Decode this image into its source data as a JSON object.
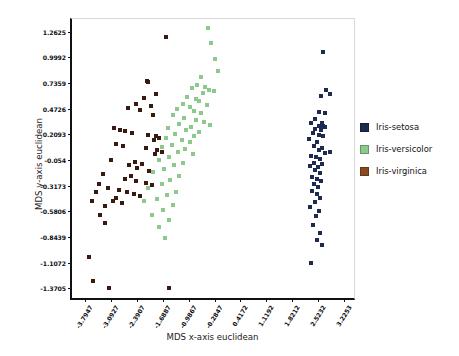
{
  "chart_data": {
    "type": "scatter",
    "title": "",
    "xlabel": "MDS x-axis euclidean",
    "ylabel": "MDS y-axis euclidean",
    "xlim": [
      -4.1507,
      3.5813
    ],
    "ylim": [
      -1.50215,
      1.39415
    ],
    "grid": false,
    "legend_position": "right",
    "xticks": [
      -3.7947,
      -3.0927,
      -2.3907,
      -1.6887,
      -0.9867,
      -0.2847,
      0.4172,
      1.1192,
      1.8212,
      2.5232,
      3.2253
    ],
    "xtick_labels": [
      "-3.7947",
      "-3.0927",
      "-2.3907",
      "-1.6887",
      "-0.9867",
      "-0.2847",
      "0.4172",
      "1.1192",
      "1.8212",
      "2.5232",
      "3.2253"
    ],
    "yticks": [
      1.2625,
      0.9992,
      0.7359,
      0.4726,
      0.2093,
      -0.054,
      -0.3173,
      -0.5806,
      -0.8439,
      -1.1072,
      -1.3705
    ],
    "ytick_labels": [
      "1.2625",
      "0.9992",
      "0.7359",
      "0.4726",
      "0.2093",
      "-0.054",
      "-0.3173",
      "-0.5806",
      "-0.8439",
      "-1.1072",
      "-1.3705"
    ],
    "series": [
      {
        "name": "Iris-setosa",
        "color": "#1d2b50",
        "points": [
          [
            2.66,
            1.06
          ],
          [
            2.73,
            0.66
          ],
          [
            2.86,
            0.62
          ],
          [
            2.6,
            0.6
          ],
          [
            2.55,
            0.44
          ],
          [
            2.7,
            0.43
          ],
          [
            2.44,
            0.37
          ],
          [
            2.33,
            0.33
          ],
          [
            2.62,
            0.33
          ],
          [
            2.54,
            0.3
          ],
          [
            2.66,
            0.3
          ],
          [
            2.7,
            0.28
          ],
          [
            2.45,
            0.26
          ],
          [
            2.6,
            0.25
          ],
          [
            2.38,
            0.22
          ],
          [
            2.56,
            0.2
          ],
          [
            2.65,
            0.19
          ],
          [
            2.29,
            0.16
          ],
          [
            2.5,
            0.13
          ],
          [
            2.42,
            0.09
          ],
          [
            2.62,
            0.07
          ],
          [
            2.54,
            0.05
          ],
          [
            2.86,
            0.03
          ],
          [
            2.7,
            0.02
          ],
          [
            2.33,
            -0.01
          ],
          [
            2.47,
            -0.02
          ],
          [
            2.58,
            -0.04
          ],
          [
            2.41,
            -0.08
          ],
          [
            2.63,
            -0.09
          ],
          [
            2.3,
            -0.12
          ],
          [
            2.52,
            -0.13
          ],
          [
            2.44,
            -0.16
          ],
          [
            2.57,
            -0.19
          ],
          [
            2.36,
            -0.23
          ],
          [
            2.49,
            -0.25
          ],
          [
            2.61,
            -0.27
          ],
          [
            2.42,
            -0.3
          ],
          [
            2.53,
            -0.33
          ],
          [
            2.35,
            -0.37
          ],
          [
            2.5,
            -0.4
          ],
          [
            2.58,
            -0.44
          ],
          [
            2.44,
            -0.49
          ],
          [
            2.31,
            -0.54
          ],
          [
            2.55,
            -0.58
          ],
          [
            2.48,
            -0.63
          ],
          [
            2.38,
            -0.72
          ],
          [
            2.57,
            -0.8
          ],
          [
            2.5,
            -0.88
          ],
          [
            2.62,
            -0.93
          ],
          [
            2.34,
            -1.11
          ]
        ]
      },
      {
        "name": "Iris-versicolor",
        "color": "#8cc98c",
        "points": [
          [
            -0.47,
            1.3
          ],
          [
            -0.38,
            1.15
          ],
          [
            -0.26,
            0.98
          ],
          [
            -0.18,
            0.86
          ],
          [
            -0.64,
            0.8
          ],
          [
            -0.75,
            0.72
          ],
          [
            -0.55,
            0.7
          ],
          [
            -0.9,
            0.69
          ],
          [
            -0.44,
            0.66
          ],
          [
            -0.31,
            0.65
          ],
          [
            -0.6,
            0.63
          ],
          [
            -1.02,
            0.59
          ],
          [
            -0.8,
            0.57
          ],
          [
            -0.7,
            0.55
          ],
          [
            -1.15,
            0.52
          ],
          [
            -0.5,
            0.51
          ],
          [
            -0.95,
            0.49
          ],
          [
            -1.3,
            0.47
          ],
          [
            -0.85,
            0.45
          ],
          [
            -0.66,
            0.43
          ],
          [
            -1.42,
            0.41
          ],
          [
            -1.1,
            0.38
          ],
          [
            -0.78,
            0.36
          ],
          [
            -0.56,
            0.34
          ],
          [
            -1.25,
            0.32
          ],
          [
            -0.4,
            0.31
          ],
          [
            -0.92,
            0.29
          ],
          [
            -1.55,
            0.27
          ],
          [
            -1.05,
            0.25
          ],
          [
            -0.7,
            0.23
          ],
          [
            -1.35,
            0.21
          ],
          [
            -0.84,
            0.19
          ],
          [
            -1.6,
            0.17
          ],
          [
            -1.18,
            0.15
          ],
          [
            -0.95,
            0.13
          ],
          [
            -1.45,
            0.1
          ],
          [
            -1.7,
            0.08
          ],
          [
            -1.08,
            0.06
          ],
          [
            -1.28,
            0.03
          ],
          [
            -0.88,
            0.01
          ],
          [
            -1.52,
            -0.02
          ],
          [
            -1.8,
            -0.05
          ],
          [
            -1.15,
            -0.08
          ],
          [
            -1.38,
            -0.11
          ],
          [
            -1.65,
            -0.15
          ],
          [
            -1.95,
            -0.18
          ],
          [
            -1.25,
            -0.22
          ],
          [
            -1.48,
            -0.26
          ],
          [
            -1.72,
            -0.3
          ],
          [
            -2.08,
            -0.34
          ],
          [
            -1.32,
            -0.38
          ],
          [
            -1.58,
            -0.41
          ],
          [
            -1.85,
            -0.45
          ],
          [
            -2.2,
            -0.48
          ],
          [
            -1.42,
            -0.52
          ],
          [
            -1.68,
            -0.57
          ],
          [
            -1.98,
            -0.62
          ],
          [
            -1.52,
            -0.67
          ],
          [
            -1.78,
            -0.74
          ],
          [
            -1.62,
            -0.85
          ]
        ]
      },
      {
        "name": "Iris-virginica",
        "color": "#3a1a0e",
        "points": [
          [
            -1.6,
            1.21
          ],
          [
            -2.12,
            0.76
          ],
          [
            -2.09,
            0.75
          ],
          [
            -1.86,
            0.62
          ],
          [
            -2.2,
            0.58
          ],
          [
            -2.42,
            0.52
          ],
          [
            -2.02,
            0.5
          ],
          [
            -2.62,
            0.48
          ],
          [
            -2.3,
            0.46
          ],
          [
            -1.95,
            0.41
          ],
          [
            -3.02,
            0.27
          ],
          [
            -2.85,
            0.25
          ],
          [
            -2.7,
            0.24
          ],
          [
            -2.52,
            0.22
          ],
          [
            -2.1,
            0.2
          ],
          [
            -1.88,
            0.19
          ],
          [
            -1.78,
            0.17
          ],
          [
            -1.92,
            0.15
          ],
          [
            -2.95,
            0.11
          ],
          [
            -2.78,
            0.09
          ],
          [
            -2.15,
            0.07
          ],
          [
            -1.84,
            0.05
          ],
          [
            -1.72,
            0.03
          ],
          [
            -1.9,
            0.01
          ],
          [
            -3.1,
            -0.05
          ],
          [
            -2.45,
            -0.07
          ],
          [
            -2.26,
            -0.09
          ],
          [
            -2.6,
            -0.11
          ],
          [
            -2.38,
            -0.14
          ],
          [
            -2.05,
            -0.17
          ],
          [
            -3.32,
            -0.2
          ],
          [
            -2.55,
            -0.22
          ],
          [
            -2.7,
            -0.25
          ],
          [
            -2.42,
            -0.27
          ],
          [
            -2.14,
            -0.29
          ],
          [
            -1.98,
            -0.31
          ],
          [
            -3.18,
            -0.34
          ],
          [
            -2.88,
            -0.36
          ],
          [
            -2.66,
            -0.38
          ],
          [
            -2.48,
            -0.4
          ],
          [
            -2.3,
            -0.42
          ],
          [
            -3.5,
            -0.38
          ],
          [
            -3.42,
            -0.3
          ],
          [
            -2.95,
            -0.44
          ],
          [
            -3.05,
            -0.47
          ],
          [
            -2.8,
            -0.5
          ],
          [
            -3.6,
            -0.48
          ],
          [
            -3.26,
            -0.53
          ],
          [
            -3.38,
            -0.62
          ],
          [
            -3.25,
            -0.7
          ],
          [
            -3.7,
            -1.05
          ],
          [
            -3.58,
            -1.3
          ],
          [
            -3.14,
            -1.37
          ],
          [
            -1.52,
            -1.37
          ]
        ]
      }
    ]
  },
  "legend": {
    "entries": [
      {
        "label": "Iris-setosa",
        "color": "#1d2b50",
        "class": "setosa"
      },
      {
        "label": "Iris-versicolor",
        "color": "#8cc98c",
        "class": "versicolor"
      },
      {
        "label": "Iris-virginica",
        "color": "#8a4a20",
        "class": "virginica"
      }
    ]
  }
}
